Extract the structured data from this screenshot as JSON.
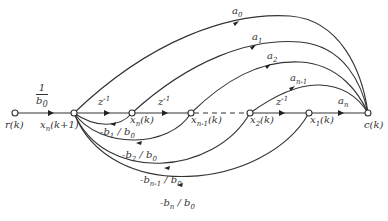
{
  "diagram": {
    "type": "signal-flow-graph",
    "nodes": [
      {
        "id": "r",
        "label": "r(k)",
        "x": 15,
        "y": 113
      },
      {
        "id": "xnk1",
        "label": "x_n(k+1)",
        "x": 74,
        "y": 113
      },
      {
        "id": "xn",
        "label": "x_n(k)",
        "x": 132,
        "y": 113
      },
      {
        "id": "xn1",
        "label": "x_{n-1}(k)",
        "x": 191,
        "y": 113
      },
      {
        "id": "x2",
        "label": "x_2(k)",
        "x": 250,
        "y": 113
      },
      {
        "id": "x1",
        "label": "x_1(k)",
        "x": 309,
        "y": 113
      },
      {
        "id": "c",
        "label": "c(k)",
        "x": 368,
        "y": 113
      }
    ],
    "edges": [
      {
        "from": "r",
        "to": "xnk1",
        "gain": "1/b0"
      },
      {
        "from": "xnk1",
        "to": "xn",
        "gain": "z^-1"
      },
      {
        "from": "xn",
        "to": "xn1",
        "gain": "z^-1"
      },
      {
        "from": "xn1",
        "to": "x2",
        "gain": "",
        "style": "dashed"
      },
      {
        "from": "x2",
        "to": "x1",
        "gain": "z^-1"
      },
      {
        "from": "x1",
        "to": "c",
        "gain": "a_n"
      },
      {
        "from": "xnk1",
        "to": "c",
        "gain": "a_0"
      },
      {
        "from": "xn",
        "to": "c",
        "gain": "a_1"
      },
      {
        "from": "xn1",
        "to": "c",
        "gain": "a_2"
      },
      {
        "from": "x2",
        "to": "c",
        "gain": "a_{n-1}"
      },
      {
        "from": "xn",
        "to": "xnk1",
        "gain": "-b_1/b_0"
      },
      {
        "from": "xn1",
        "to": "xnk1",
        "gain": "-b_2/b_0"
      },
      {
        "from": "x2",
        "to": "xnk1",
        "gain": "-b_{n-1}/b_0"
      },
      {
        "from": "x1",
        "to": "xnk1",
        "gain": "-b_n/b_0"
      }
    ]
  },
  "labels": {
    "r": {
      "main": "r",
      "arg": "(k)"
    },
    "xnk1": {
      "main": "x",
      "sub": "n",
      "arg": "(k+1)"
    },
    "xn": {
      "main": "x",
      "sub": "n",
      "arg": "(k)"
    },
    "xn1": {
      "main": "x",
      "sub": "n-1",
      "arg": "(k)"
    },
    "x2": {
      "main": "x",
      "sub": "2",
      "arg": "(k)"
    },
    "x1": {
      "main": "x",
      "sub": "1",
      "arg": "(k)"
    },
    "c": {
      "main": "c",
      "arg": "(k)"
    },
    "input_gain": {
      "num": "1",
      "den_main": "b",
      "den_sub": "0"
    },
    "z1": {
      "main": "z",
      "sup": "-1"
    },
    "z2": {
      "main": "z",
      "sup": "-1"
    },
    "z3": {
      "main": "z",
      "sup": "-1"
    },
    "a0": {
      "main": "a",
      "sub": "0"
    },
    "a1": {
      "main": "a",
      "sub": "1"
    },
    "a2": {
      "main": "a",
      "sub": "2"
    },
    "an1": {
      "main": "a",
      "sub": "n-1"
    },
    "an": {
      "main": "a",
      "sub": "n"
    },
    "b1": {
      "pre": "-b",
      "sub": "1",
      "mid": " / b",
      "sub2": "0"
    },
    "b2": {
      "pre": "-b",
      "sub": "2",
      "mid": " / b",
      "sub2": "0"
    },
    "bn1": {
      "pre": "-b",
      "sub": "n-1",
      "mid": " / b",
      "sub2": "0"
    },
    "bn": {
      "pre": "-b",
      "sub": "n",
      "mid": " / b",
      "sub2": "0"
    }
  }
}
